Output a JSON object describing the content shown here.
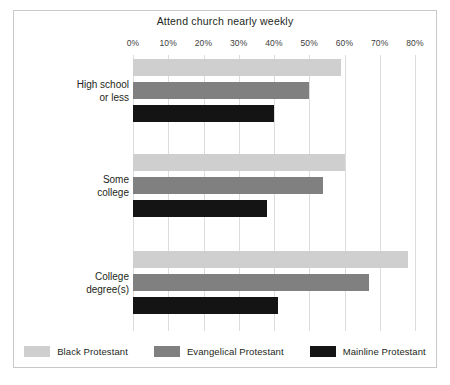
{
  "chart_data": {
    "type": "bar",
    "orientation": "horizontal",
    "title": "Attend church nearly weekly",
    "xlabel": "",
    "ylabel": "",
    "xlim": [
      0,
      80
    ],
    "xticks": [
      0,
      10,
      20,
      30,
      40,
      50,
      60,
      70,
      80
    ],
    "xtick_labels": [
      "0%",
      "10%",
      "20%",
      "30%",
      "40%",
      "50%",
      "60%",
      "70%",
      "80%"
    ],
    "grid": true,
    "legend_position": "bottom",
    "categories": [
      "High school or less",
      "Some college",
      "College degree(s)"
    ],
    "category_lines": [
      [
        "High school",
        "or less"
      ],
      [
        "Some",
        "college"
      ],
      [
        "College",
        "degree(s)"
      ]
    ],
    "series": [
      {
        "name": "Black Protestant",
        "color": "#cfcfcf",
        "values": [
          59,
          60,
          78
        ]
      },
      {
        "name": "Evangelical Protestant",
        "color": "#808080",
        "values": [
          50,
          54,
          67
        ]
      },
      {
        "name": "Mainline Protestant",
        "color": "#141414",
        "values": [
          40,
          38,
          41
        ]
      }
    ]
  },
  "legend": {
    "items": [
      {
        "label": "Black Protestant",
        "color": "#cfcfcf"
      },
      {
        "label": "Evangelical Protestant",
        "color": "#808080"
      },
      {
        "label": "Mainline Protestant",
        "color": "#141414"
      }
    ]
  },
  "colors": {
    "frame_border": "#c9c9c9",
    "gridline": "#dcdcdc",
    "text": "#231f20",
    "background": "#ffffff"
  }
}
